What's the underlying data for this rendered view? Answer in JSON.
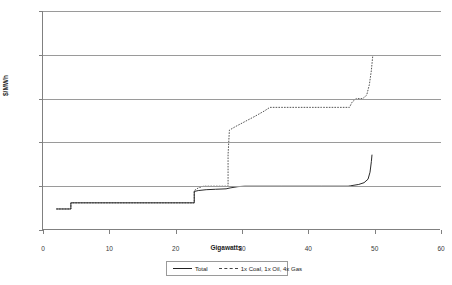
{
  "chart_data": {
    "type": "line",
    "title": "",
    "xlabel": "Gigawatts",
    "ylabel": "$/MWh",
    "xlim": [
      0,
      60
    ],
    "ylim": [
      0,
      250
    ],
    "xticks": [
      0,
      10,
      20,
      30,
      40,
      50,
      60
    ],
    "yticks": [
      0,
      50,
      100,
      150,
      200,
      250
    ],
    "grid": "horizontal",
    "legend_position": "bottom-center",
    "series": [
      {
        "name": "Total",
        "style": "solid",
        "color": "#2b2b2b",
        "points": [
          [
            2.0,
            24
          ],
          [
            4.2,
            24
          ],
          [
            4.2,
            31
          ],
          [
            22.8,
            31
          ],
          [
            22.8,
            44
          ],
          [
            23.4,
            45
          ],
          [
            24.6,
            46
          ],
          [
            26.0,
            46.5
          ],
          [
            27.6,
            47
          ],
          [
            28.2,
            48
          ],
          [
            29.4,
            49.5
          ],
          [
            30.4,
            50
          ],
          [
            36.0,
            50
          ],
          [
            42.0,
            50
          ],
          [
            46.0,
            50
          ],
          [
            46.4,
            50.5
          ],
          [
            47.6,
            52
          ],
          [
            48.4,
            54
          ],
          [
            49.0,
            58
          ],
          [
            49.3,
            66
          ],
          [
            49.5,
            78
          ],
          [
            49.6,
            86
          ]
        ]
      },
      {
        "name": "1x Coal, 1x Oil, 4x Gas",
        "style": "dashed",
        "color": "#555555",
        "points": [
          [
            2.0,
            24
          ],
          [
            4.2,
            24
          ],
          [
            4.2,
            31
          ],
          [
            22.8,
            31
          ],
          [
            22.8,
            45
          ],
          [
            23.4,
            48
          ],
          [
            24.2,
            50
          ],
          [
            26.0,
            50
          ],
          [
            27.6,
            50
          ],
          [
            27.9,
            50
          ],
          [
            27.9,
            86
          ],
          [
            28.0,
            100
          ],
          [
            28.1,
            114
          ],
          [
            29.0,
            118
          ],
          [
            30.5,
            124
          ],
          [
            32.0,
            130
          ],
          [
            33.4,
            136
          ],
          [
            34.2,
            140
          ],
          [
            38.0,
            140
          ],
          [
            42.0,
            140
          ],
          [
            46.2,
            140
          ],
          [
            46.6,
            146
          ],
          [
            47.2,
            150
          ],
          [
            48.2,
            150
          ],
          [
            48.8,
            154
          ],
          [
            49.2,
            166
          ],
          [
            49.5,
            182
          ],
          [
            49.7,
            198
          ]
        ]
      }
    ]
  },
  "axes": {
    "y_title": "$/MWh",
    "x_title": "Gigawatts",
    "y_tick_labels": [
      "250",
      "200",
      "150",
      "100",
      "50",
      "0"
    ],
    "x_tick_labels": [
      "0",
      "10",
      "20",
      "30",
      "40",
      "50",
      "60"
    ]
  },
  "legend": {
    "items": [
      {
        "label": "Total",
        "style": "solid"
      },
      {
        "label": "1x Coal, 1x Oil, 4x Gas",
        "style": "dashed"
      }
    ]
  },
  "colors": {
    "total_line": "#2b2b2b",
    "mix_line": "#555555",
    "gridline": "#9a9a9a",
    "axis": "#808080",
    "background": "#ffffff"
  }
}
